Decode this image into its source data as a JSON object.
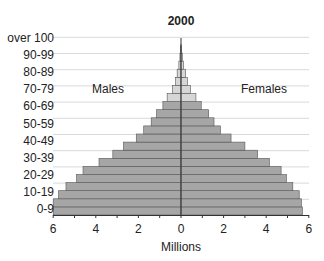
{
  "chart_data": {
    "type": "bar",
    "subtype": "population-pyramid",
    "title": "2000",
    "xlabel": "Millions",
    "ylabel": "",
    "xlim": [
      -6,
      6
    ],
    "x_ticks": [
      "6",
      "4",
      "2",
      "0",
      "2",
      "4",
      "6"
    ],
    "y_tick_labels": [
      "over 100",
      "90-99",
      "80-89",
      "70-79",
      "60-69",
      "50-59",
      "40-49",
      "30-39",
      "20-29",
      "10-19",
      "0-9"
    ],
    "categories": [
      "0-4",
      "5-9",
      "10-14",
      "15-19",
      "20-24",
      "25-29",
      "30-34",
      "35-39",
      "40-44",
      "45-49",
      "50-54",
      "55-59",
      "60-64",
      "65-69",
      "70-74",
      "75-79",
      "80-84",
      "85-89",
      "90-94",
      "95-99",
      "100+"
    ],
    "series": [
      {
        "name": "Males",
        "values": [
          6.0,
          6.0,
          5.75,
          5.4,
          4.9,
          4.6,
          3.85,
          3.2,
          2.7,
          2.1,
          1.75,
          1.4,
          1.15,
          0.85,
          0.65,
          0.4,
          0.25,
          0.18,
          0.1,
          0.05,
          0.02
        ]
      },
      {
        "name": "Females",
        "values": [
          5.7,
          5.65,
          5.55,
          5.25,
          4.95,
          4.7,
          4.15,
          3.6,
          3.0,
          2.35,
          1.85,
          1.55,
          1.3,
          0.95,
          0.7,
          0.45,
          0.3,
          0.22,
          0.12,
          0.06,
          0.02
        ]
      }
    ],
    "annotations": [
      "Males",
      "Females"
    ],
    "grid": true,
    "legend": "inline labels"
  },
  "labels": {
    "title": "2000",
    "males": "Males",
    "females": "Females",
    "xlabel": "Millions"
  },
  "colors": {
    "bar_young": "#a6a6a6",
    "bar_old": "#d6d6d6",
    "bar_outline": "#555555",
    "grid": "#d9d9d9",
    "axis": "#333333"
  }
}
